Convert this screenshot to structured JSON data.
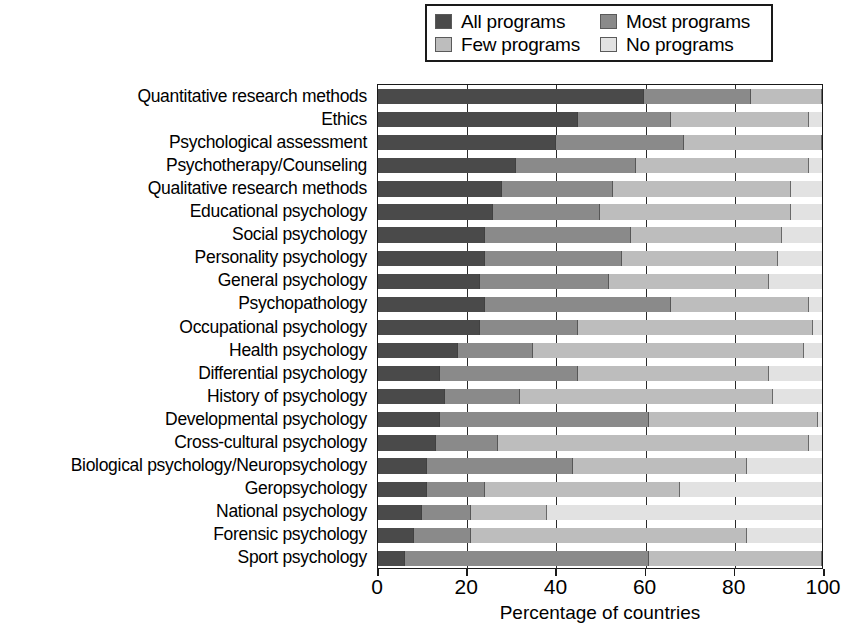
{
  "legend": {
    "entries": [
      {
        "label": "All programs",
        "key": "all",
        "color": "#4a4a4a"
      },
      {
        "label": "Most programs",
        "key": "most",
        "color": "#8a8a8a"
      },
      {
        "label": "Few programs",
        "key": "few",
        "color": "#bdbdbd"
      },
      {
        "label": "No programs",
        "key": "no",
        "color": "#e2e2e2"
      }
    ]
  },
  "axis": {
    "x_title": "Percentage of countries",
    "x_ticks": [
      0,
      20,
      40,
      60,
      80,
      100
    ],
    "x_tick_labels": [
      "0",
      "20",
      "40",
      "60",
      "80",
      "100"
    ],
    "x_min": 0,
    "x_max": 100
  },
  "chart_data": {
    "type": "bar",
    "orientation": "horizontal",
    "stacked": true,
    "stack_mode": "percent",
    "title": "",
    "subtitle": "",
    "xlabel": "Percentage of countries",
    "ylabel": "",
    "xlim": [
      0,
      100
    ],
    "grid": true,
    "grid_axis": "x",
    "legend_position": "top",
    "categories": [
      "Quantitative research methods",
      "Ethics",
      "Psychological assessment",
      "Psychotherapy/Counseling",
      "Qualitative research methods",
      "Educational psychology",
      "Social psychology",
      "Personality psychology",
      "General psychology",
      "Psychopathology",
      "Occupational psychology",
      "Health psychology",
      "Differential psychology",
      "History of psychology",
      "Developmental psychology",
      "Cross-cultural psychology",
      "Biological psychology/Neuropsychology",
      "Geropsychology",
      "National psychology",
      "Forensic psychology",
      "Sport psychology"
    ],
    "series": [
      {
        "name": "All programs",
        "color": "#4a4a4a",
        "values": [
          60,
          45,
          40,
          31,
          28,
          26,
          24,
          24,
          23,
          24,
          23,
          18,
          14,
          15,
          14,
          13,
          11,
          11,
          10,
          8,
          6
        ]
      },
      {
        "name": "Most programs",
        "color": "#8a8a8a",
        "values": [
          24,
          21,
          29,
          27,
          25,
          24,
          33,
          31,
          29,
          42,
          22,
          17,
          31,
          17,
          47,
          14,
          33,
          13,
          11,
          13,
          55
        ]
      },
      {
        "name": "Few programs",
        "color": "#bdbdbd",
        "values": [
          16,
          31,
          31,
          39,
          40,
          43,
          34,
          35,
          36,
          31,
          53,
          61,
          43,
          57,
          38,
          70,
          39,
          44,
          17,
          62,
          39
        ]
      },
      {
        "name": "No programs",
        "color": "#e2e2e2",
        "values": [
          0,
          3,
          0,
          3,
          7,
          7,
          9,
          10,
          12,
          3,
          2,
          4,
          12,
          11,
          1,
          3,
          17,
          32,
          62,
          17,
          0
        ]
      }
    ]
  }
}
